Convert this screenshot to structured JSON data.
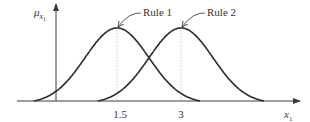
{
  "diagram": {
    "y_axis_label": "μ",
    "y_axis_subscript": "x",
    "y_axis_subsubscript": "1",
    "x_axis_label": "x",
    "x_axis_subscript": "1",
    "ticks": [
      {
        "value": 1.5,
        "label": "1.5"
      },
      {
        "value": 3,
        "label": "3"
      }
    ],
    "rules": [
      {
        "name": "Rule 1",
        "center": 1.5,
        "label": "Rule 1"
      },
      {
        "name": "Rule 2",
        "center": 3,
        "label": "Rule 2"
      }
    ],
    "colors": {
      "curve": "#2b2b2b",
      "axis": "#3a3a3a",
      "guide": "#bdbdbd",
      "text": "#333333"
    }
  }
}
